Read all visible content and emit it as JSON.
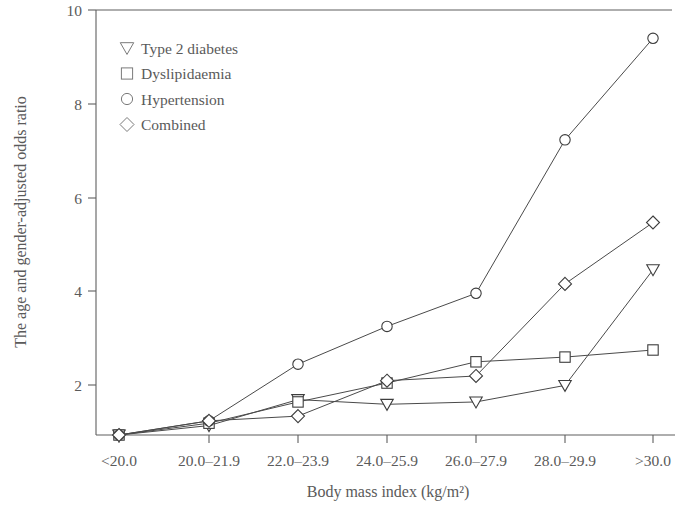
{
  "chart_data": {
    "type": "line",
    "title": "",
    "subtitle": "",
    "xlabel": "Body mass index (kg/m²)",
    "ylabel": "The age and gender-adjusted odds ratio",
    "categories": [
      "<20.0",
      "20.0–21.9",
      "22.0–23.9",
      "24.0–25.9",
      "26.0–27.9",
      "28.0–29.9",
      ">30.0"
    ],
    "xtick_labels": [
      "<20.0",
      "20.0–21.9",
      "22.0–23.9",
      "24.0–25.9",
      "26.0–27.9",
      "28.0–29.9",
      ">30.0"
    ],
    "ytick_labels": [
      "2",
      "4",
      "6",
      "8",
      "10"
    ],
    "ytick_values": [
      2,
      4,
      6,
      8,
      10
    ],
    "ylim": [
      1.0,
      10.0
    ],
    "grid": false,
    "legend_position": "upper left",
    "series": [
      {
        "name": "Type 2 diabetes",
        "marker": "triangle-down",
        "values": [
          1.0,
          1.2,
          1.75,
          1.65,
          1.7,
          2.05,
          4.5
        ]
      },
      {
        "name": "Dyslipidaemia",
        "marker": "square",
        "values": [
          1.0,
          1.25,
          1.7,
          2.1,
          2.55,
          2.65,
          2.8
        ]
      },
      {
        "name": "Hypertension",
        "marker": "circle",
        "values": [
          1.0,
          1.3,
          2.5,
          3.3,
          4.0,
          7.25,
          9.4
        ]
      },
      {
        "name": "Combined",
        "marker": "diamond",
        "values": [
          1.0,
          1.3,
          1.4,
          2.15,
          2.25,
          4.2,
          5.5
        ]
      }
    ],
    "colors": {
      "line": "#4a4a4a",
      "marker_stroke": "#3d3d3d",
      "marker_fill": "#ffffff",
      "axis": "#5f5f5f",
      "text": "#5a5a5a",
      "background": "#ffffff"
    }
  },
  "legend": {
    "entries": [
      {
        "label": "Type 2 diabetes",
        "marker": "triangle-down"
      },
      {
        "label": "Dyslipidaemia",
        "marker": "square"
      },
      {
        "label": "Hypertension",
        "marker": "circle"
      },
      {
        "label": "Combined",
        "marker": "diamond"
      }
    ]
  }
}
